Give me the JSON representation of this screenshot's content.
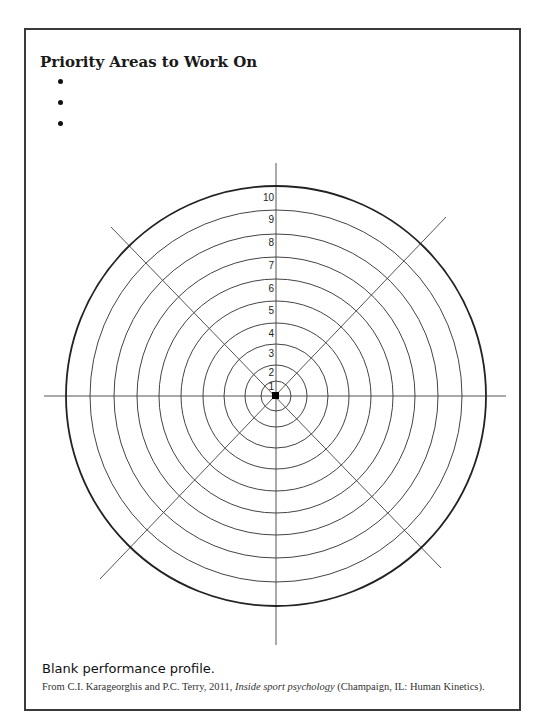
{
  "document": {
    "title": "Priority Areas to Work On",
    "priority_bullets": [
      "",
      "",
      ""
    ],
    "profile": {
      "type": "blank performance profile (radial target)",
      "rings": [
        "1",
        "2",
        "3",
        "4",
        "5",
        "6",
        "7",
        "8",
        "9",
        "10"
      ],
      "spokes": 8
    },
    "caption": "Blank performance profile.",
    "source": {
      "prefix": "From C.I. Karageorghis and P.C. Terry, 2011, ",
      "book": "Inside sport psychology",
      "suffix": " (Champaign, IL: Human Kinetics)."
    }
  }
}
